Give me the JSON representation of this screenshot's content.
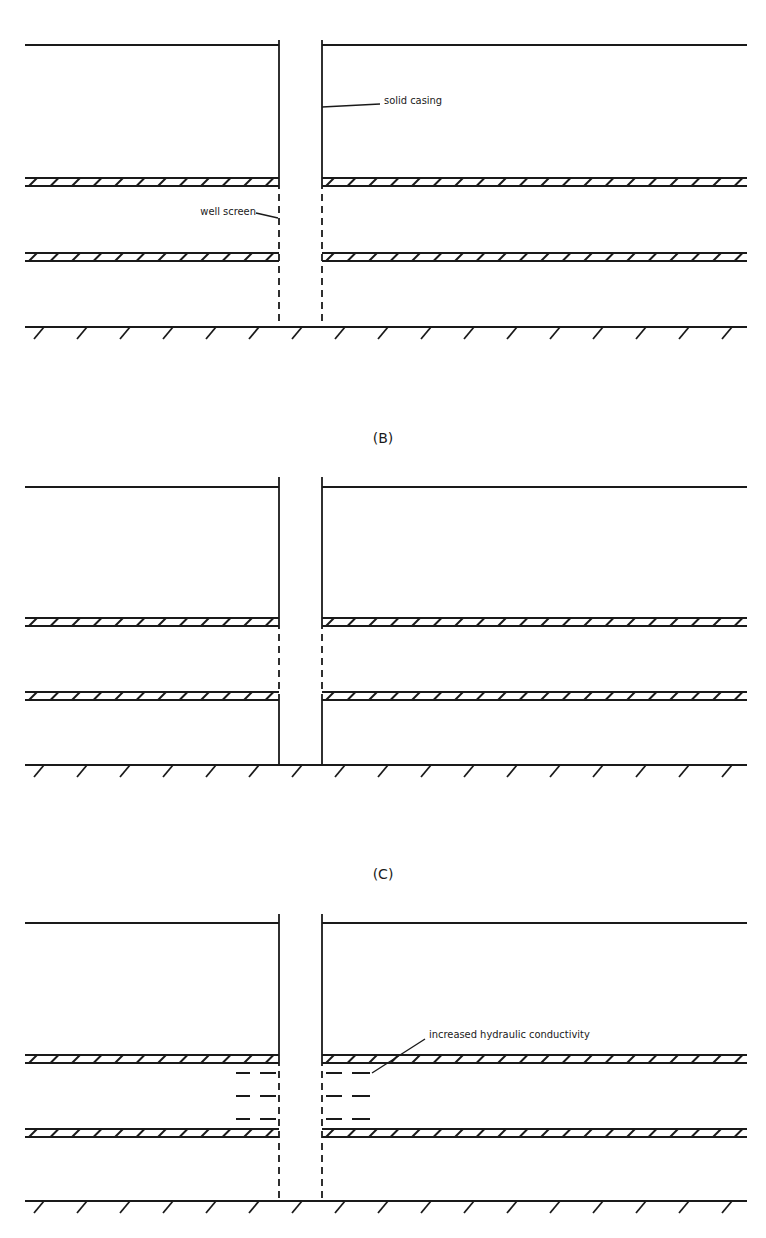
{
  "panels": [
    {
      "id": "A",
      "label": "",
      "top_line_y": 45,
      "aquitards_y": [
        182,
        257
      ],
      "ground_y": 327,
      "well_segments": [
        {
          "from": 40,
          "to": 182,
          "type": "solid"
        },
        {
          "from": 182,
          "to": 327,
          "type": "screen"
        }
      ],
      "annotations": [
        {
          "text": "solid casing",
          "x": 384,
          "y": 104,
          "leader": [
            [
              322,
              107
            ],
            [
              380,
              104
            ]
          ]
        },
        {
          "text": "well screen",
          "x": 200,
          "y": 215,
          "leader": [
            [
              256,
              213
            ],
            [
              278,
              218
            ]
          ],
          "anchor": "end"
        }
      ]
    },
    {
      "id": "B",
      "label": "(B)",
      "label_y": 438,
      "top_line_y": 487,
      "aquitards_y": [
        622,
        696
      ],
      "ground_y": 765,
      "well_segments": [
        {
          "from": 477,
          "to": 622,
          "type": "solid"
        },
        {
          "from": 622,
          "to": 696,
          "type": "screen"
        },
        {
          "from": 696,
          "to": 765,
          "type": "solid"
        }
      ],
      "annotations": []
    },
    {
      "id": "C",
      "label": "(C)",
      "label_y": 874,
      "top_line_y": 923,
      "aquitards_y": [
        1059,
        1133
      ],
      "ground_y": 1201,
      "well_segments": [
        {
          "from": 914,
          "to": 1059,
          "type": "solid"
        },
        {
          "from": 1059,
          "to": 1201,
          "type": "screen"
        }
      ],
      "dashes_zone": {
        "from": 1059,
        "to": 1133
      },
      "annotations": [
        {
          "text": "increased hydraulic conductivity",
          "x": 429,
          "y": 1038,
          "leader": [
            [
              372,
              1073
            ],
            [
              425,
              1039
            ]
          ]
        }
      ]
    }
  ],
  "well": {
    "left_x": 279,
    "right_x": 322
  },
  "extent": {
    "left_x": 25,
    "right_x": 747
  }
}
